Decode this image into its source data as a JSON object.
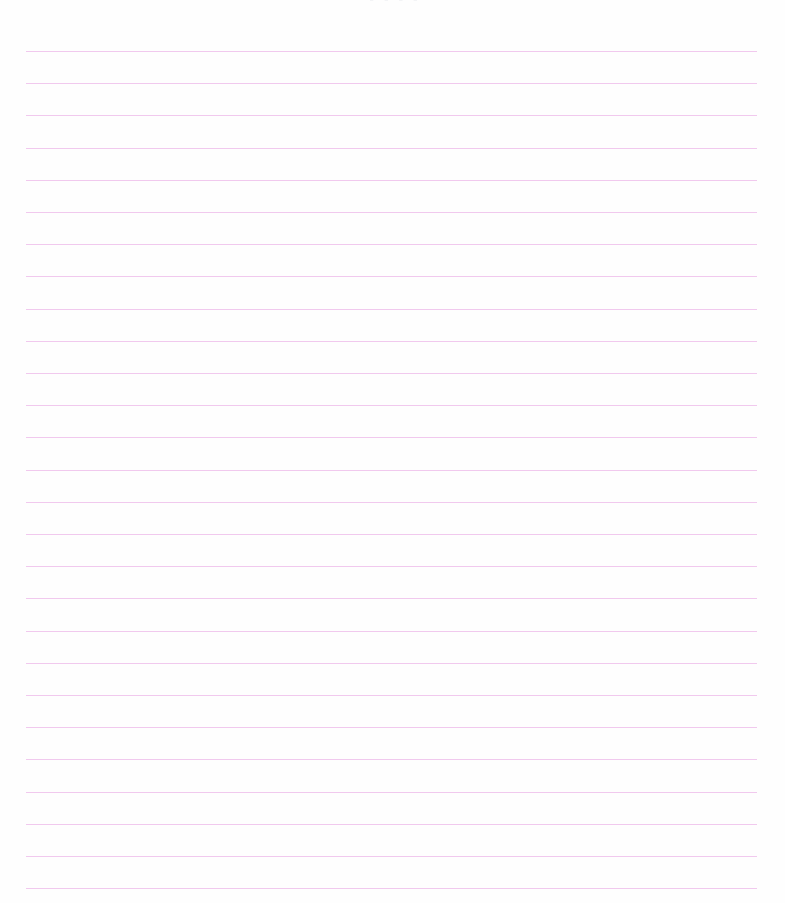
{
  "document": {
    "type": "lined notebook page",
    "header_fragment": "- - - -",
    "rule_color": "#f1c9ee",
    "rule_count": 27,
    "rule_left": 26,
    "rule_right": 757,
    "rule_first_y": 51,
    "rule_spacing": 32.2,
    "content": []
  }
}
